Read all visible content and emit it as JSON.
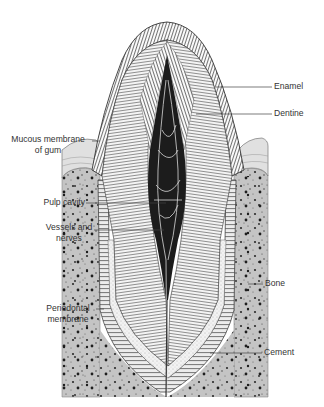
{
  "diagram": {
    "colors": {
      "background": "#ffffff",
      "bone": "#c4c4c4",
      "bone_speckle": "#2a2a2a",
      "gum": "#e2e2e2",
      "pulp": "#1c1c1c",
      "line": "#3a3a3a",
      "label_text": "#333333"
    },
    "labels": {
      "enamel": "Enamel",
      "dentine": "Dentine",
      "mucous_line1": "Mucous membrane",
      "mucous_line2": "of gum",
      "pulp_cavity": "Pulp cavity",
      "vessels_line1": "Vessels and",
      "vessels_line2": "nerves",
      "bone": "Bone",
      "periodontal_line1": "Periodontal",
      "periodontal_line2": "membrane",
      "cement": "Cement"
    }
  }
}
